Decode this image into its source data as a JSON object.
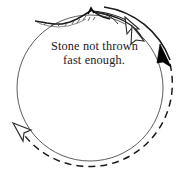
{
  "figure": {
    "name": "newtons-cannonball-insufficient-speed-diagram",
    "caption": {
      "line1": "Stone not thrown",
      "line2": "fast enough."
    },
    "colors": {
      "background": "#ffffff",
      "ink": "#1a1a1a",
      "thin_line": "#4a4a4a",
      "caption_text": "#24201e",
      "arrowhead_solid": "#000000",
      "arrowhead_hollow_fill": "#ffffff"
    },
    "elements": {
      "mountain_peak_label": "mountain-peak",
      "inner_circle_label": "inner-solid-circle",
      "dashed_circle_label": "outer-dashed-trajectory",
      "short_trajectory_1_label": "short-trajectory-upper",
      "short_trajectory_2_label": "short-trajectory-lower",
      "solid_arrowhead_label": "solid-arrowhead-right",
      "hollow_arrowhead_label": "hollow-arrowhead-lower-left",
      "hollow_arrowhead_short_1_label": "hollow-arrowhead-short-upper",
      "hollow_arrowhead_short_2_label": "hollow-arrowhead-short-lower"
    },
    "geometry": {
      "inner_circle": {
        "cx": 90,
        "cy": 88,
        "r": 73
      },
      "dashed_circle": {
        "cx": 90,
        "cy": 88,
        "r": 83
      },
      "peak": {
        "x": 92,
        "y": 10
      },
      "solid_arrowhead_tip": {
        "x": 170,
        "y": 62
      },
      "hollow_arrowhead_tip": {
        "x": 14,
        "y": 124
      },
      "dash_pattern": "7 5",
      "stroke_widths": {
        "thin": 0.9,
        "medium": 1.4,
        "thick": 1.8
      }
    }
  }
}
